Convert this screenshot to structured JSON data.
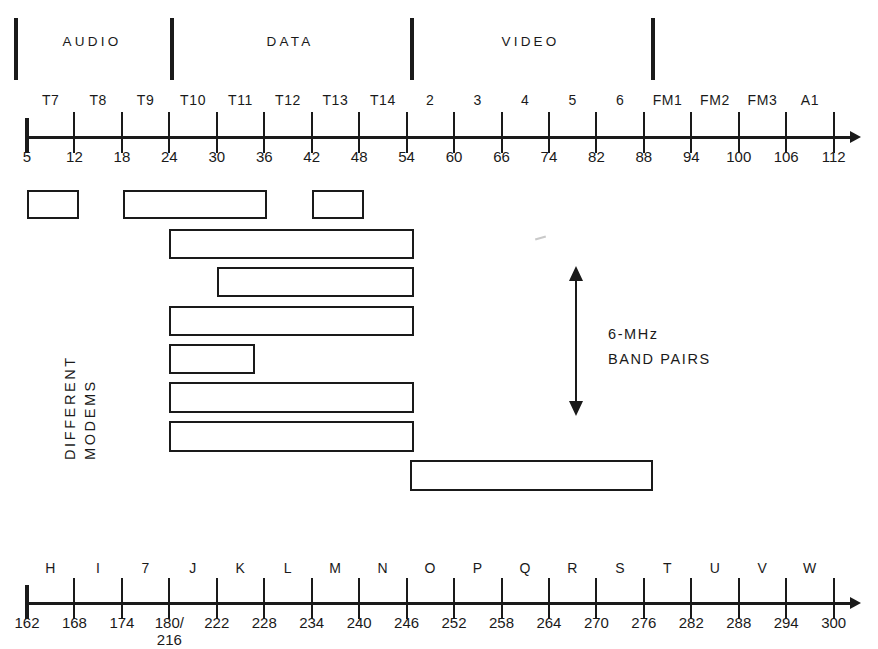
{
  "diagram": {
    "ink_color": "#1a1a1a",
    "background": "#ffffff"
  },
  "categories": [
    {
      "label": "AUDIO",
      "start_mhz": 5,
      "end_mhz": 24
    },
    {
      "label": "DATA",
      "start_mhz": 24,
      "end_mhz": 54
    },
    {
      "label": "VIDEO",
      "start_mhz": 54,
      "end_mhz": 88
    }
  ],
  "separator_values": [
    5,
    24,
    54,
    88
  ],
  "top_axis": {
    "unit": "MHz",
    "channel_names": [
      "T7",
      "T8",
      "T9",
      "T10",
      "T11",
      "T12",
      "T13",
      "T14",
      "2",
      "3",
      "4",
      "5",
      "6",
      "FM1",
      "FM2",
      "FM3",
      "A1"
    ],
    "tick_values": [
      5,
      12,
      18,
      24,
      30,
      36,
      42,
      48,
      54,
      60,
      66,
      74,
      82,
      88,
      94,
      100,
      106,
      112
    ]
  },
  "bottom_axis": {
    "unit": "MHz",
    "channel_names": [
      "H",
      "I",
      "7",
      "J",
      "K",
      "L",
      "M",
      "N",
      "O",
      "P",
      "Q",
      "R",
      "S",
      "T",
      "U",
      "V",
      "W"
    ],
    "tick_values": [
      "162",
      "168",
      "174",
      "180/",
      "222",
      "228",
      "234",
      "240",
      "246",
      "252",
      "258",
      "264",
      "270",
      "276",
      "282",
      "288",
      "294",
      "300"
    ],
    "split_tick": {
      "index": 3,
      "primary": "180/",
      "secondary": "216"
    }
  },
  "side_label": {
    "line1": "DIFFERENT",
    "line2": "MODEMS"
  },
  "annotation": {
    "line1": "6-MHz",
    "line2": "BAND PAIRS"
  },
  "chart_data": {
    "type": "bar",
    "xlabel": "Frequency (MHz)",
    "ylabel": "DIFFERENT MODEMS",
    "xlim": [
      5,
      112
    ],
    "grid": false,
    "legend": "none",
    "series": [
      {
        "name": "Modem 1",
        "row": 1,
        "segments": [
          {
            "start_mhz": 5,
            "end_mhz": 12
          },
          {
            "start_mhz": 18,
            "end_mhz": 36
          },
          {
            "start_mhz": 42,
            "end_mhz": 48
          }
        ]
      },
      {
        "name": "Modem 2",
        "row": 2,
        "segments": [
          {
            "start_mhz": 24,
            "end_mhz": 54
          }
        ]
      },
      {
        "name": "Modem 3",
        "row": 3,
        "segments": [
          {
            "start_mhz": 30,
            "end_mhz": 54
          }
        ]
      },
      {
        "name": "Modem 4",
        "row": 4,
        "segments": [
          {
            "start_mhz": 24,
            "end_mhz": 54
          }
        ]
      },
      {
        "name": "Modem 5",
        "row": 5,
        "segments": [
          {
            "start_mhz": 24,
            "end_mhz": 35
          }
        ]
      },
      {
        "name": "Modem 6",
        "row": 6,
        "segments": [
          {
            "start_mhz": 24,
            "end_mhz": 54
          }
        ]
      },
      {
        "name": "Modem 7",
        "row": 7,
        "segments": [
          {
            "start_mhz": 24,
            "end_mhz": 54
          }
        ]
      },
      {
        "name": "Modem 8",
        "row": 8,
        "segments": [
          {
            "start_mhz": 54,
            "end_mhz": 84
          }
        ]
      }
    ],
    "annotations": [
      {
        "text": "6-MHz BAND PAIRS",
        "type": "double-arrow",
        "orientation": "vertical"
      }
    ]
  },
  "geometry": {
    "axis_x0": 27,
    "tick_step": 47.45,
    "top_axis_y": 137,
    "bottom_axis_y": 603,
    "bars": [
      {
        "row": 1,
        "y": 190,
        "h": 29,
        "boxes": [
          {
            "x": 27,
            "w": 52
          },
          {
            "x": 123,
            "w": 144
          },
          {
            "x": 312,
            "w": 52
          }
        ]
      },
      {
        "row": 2,
        "y": 229,
        "h": 30,
        "boxes": [
          {
            "x": 169,
            "w": 245
          }
        ]
      },
      {
        "row": 3,
        "y": 267,
        "h": 30,
        "boxes": [
          {
            "x": 217,
            "w": 197
          }
        ]
      },
      {
        "row": 4,
        "y": 306,
        "h": 30,
        "boxes": [
          {
            "x": 169,
            "w": 245
          }
        ]
      },
      {
        "row": 5,
        "y": 344,
        "h": 30,
        "boxes": [
          {
            "x": 169,
            "w": 86
          }
        ]
      },
      {
        "row": 6,
        "y": 382,
        "h": 31,
        "boxes": [
          {
            "x": 169,
            "w": 245
          }
        ]
      },
      {
        "row": 7,
        "y": 421,
        "h": 31,
        "boxes": [
          {
            "x": 169,
            "w": 245
          }
        ]
      },
      {
        "row": 8,
        "y": 460,
        "h": 31,
        "boxes": [
          {
            "x": 410,
            "w": 243
          }
        ]
      }
    ]
  }
}
